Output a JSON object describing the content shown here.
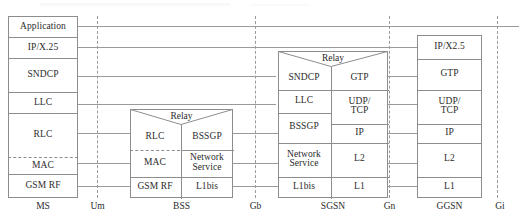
{
  "diagram": {
    "line_color": "#9a9a9a",
    "box_color": "#8d8d8d",
    "text_color": "#2b2b2b",
    "relay_label": "Relay"
  },
  "nodes": [
    {
      "id": "ms",
      "label": "MS"
    },
    {
      "id": "bss",
      "label": "BSS"
    },
    {
      "id": "sgsn",
      "label": "SGSN"
    },
    {
      "id": "ggsn",
      "label": "GGSN"
    }
  ],
  "interfaces": [
    {
      "id": "um",
      "label": "Um"
    },
    {
      "id": "gb",
      "label": "Gb"
    },
    {
      "id": "gn",
      "label": "Gn"
    },
    {
      "id": "gi",
      "label": "Gi"
    }
  ],
  "stacks": {
    "ms": {
      "node": "MS",
      "layers": [
        {
          "label": "Application"
        },
        {
          "label": "IP/X.25"
        },
        {
          "label": "SNDCP"
        },
        {
          "label": "LLC"
        },
        {
          "label": "RLC"
        },
        {
          "label": "MAC"
        },
        {
          "label": "GSM RF"
        }
      ]
    },
    "bss": {
      "node": "BSS",
      "relay": "Relay",
      "left_column": [
        {
          "label": "RLC"
        },
        {
          "label": "MAC"
        },
        {
          "label": "GSM RF"
        }
      ],
      "right_column": [
        {
          "label": "BSSGP"
        },
        {
          "label": "Network Service",
          "line1": "Network",
          "line2": "Service"
        },
        {
          "label": "L1bis"
        }
      ]
    },
    "sgsn": {
      "node": "SGSN",
      "relay": "Relay",
      "left_column": [
        {
          "label": "SNDCP"
        },
        {
          "label": "LLC"
        },
        {
          "label": "BSSGP"
        },
        {
          "label": "Network Service",
          "line1": "Network",
          "line2": "Service"
        },
        {
          "label": "L1bis"
        }
      ],
      "right_column": [
        {
          "label": "GTP"
        },
        {
          "label": "UDP/TCP",
          "line1": "UDP/",
          "line2": "TCP"
        },
        {
          "label": "IP"
        },
        {
          "label": "L2"
        },
        {
          "label": "L1"
        }
      ]
    },
    "ggsn": {
      "node": "GGSN",
      "layers": [
        {
          "label": "IP/X2.5"
        },
        {
          "label": "GTP"
        },
        {
          "label": "UDP/TCP",
          "line1": "UDP/",
          "line2": "TCP"
        },
        {
          "label": "IP"
        },
        {
          "label": "L2"
        },
        {
          "label": "L1"
        }
      ]
    }
  }
}
